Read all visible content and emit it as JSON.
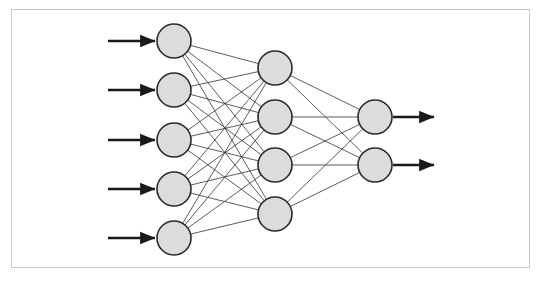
{
  "figure": {
    "frame": {
      "border_color": "#c9c9c9",
      "background": "#ffffff"
    }
  },
  "caption": {
    "label": "",
    "text": "",
    "note": "caption text is clipped at the bottom image edge and is not legible"
  },
  "style": {
    "node_fill": "#dcdcdc",
    "node_stroke": "#2a2a2a",
    "node_stroke_width": 1.6,
    "edge_color": "#333333",
    "edge_width": 0.8,
    "arrow_color": "#1a1a1a",
    "arrow_width": 2.4,
    "node_radius": 17
  },
  "chart_data": {
    "type": "diagram",
    "diagram_kind": "neural-network",
    "layers": [
      {
        "name": "input",
        "count": 5,
        "x": 174,
        "nodes": [
          {
            "id": "i1",
            "cx": 174,
            "cy": 41
          },
          {
            "id": "i2",
            "cx": 174,
            "cy": 90
          },
          {
            "id": "i3",
            "cx": 174,
            "cy": 140
          },
          {
            "id": "i4",
            "cx": 174,
            "cy": 189
          },
          {
            "id": "i5",
            "cx": 174,
            "cy": 238
          }
        ]
      },
      {
        "name": "hidden",
        "count": 4,
        "x": 275,
        "nodes": [
          {
            "id": "h1",
            "cx": 275,
            "cy": 68
          },
          {
            "id": "h2",
            "cx": 275,
            "cy": 117
          },
          {
            "id": "h3",
            "cx": 275,
            "cy": 165
          },
          {
            "id": "h4",
            "cx": 275,
            "cy": 214
          }
        ]
      },
      {
        "name": "output",
        "count": 2,
        "x": 375,
        "nodes": [
          {
            "id": "o1",
            "cx": 375,
            "cy": 117
          },
          {
            "id": "o2",
            "cx": 375,
            "cy": 165
          }
        ]
      }
    ],
    "input_arrows": [
      {
        "y": 41,
        "x1": 108,
        "x2": 155
      },
      {
        "y": 90,
        "x1": 108,
        "x2": 155
      },
      {
        "y": 140,
        "x1": 108,
        "x2": 155
      },
      {
        "y": 189,
        "x1": 108,
        "x2": 155
      },
      {
        "y": 238,
        "x1": 108,
        "x2": 155
      }
    ],
    "output_arrows": [
      {
        "y": 117,
        "x1": 393,
        "x2": 434
      },
      {
        "y": 165,
        "x1": 393,
        "x2": 434
      }
    ],
    "connections": {
      "input_to_hidden": "fully-connected",
      "input_to_hidden_count": 20,
      "hidden_to_output": "fully-connected",
      "hidden_to_output_count": 8
    }
  }
}
